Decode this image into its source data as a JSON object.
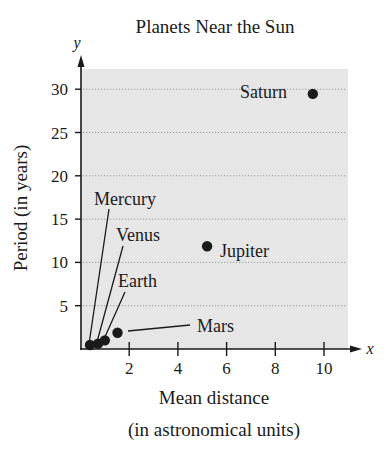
{
  "chart_data": {
    "type": "scatter",
    "title": "Planets Near the Sun",
    "xlabel_lines": [
      "Mean distance",
      "(in astronomical units)"
    ],
    "ylabel": "Period (in years)",
    "x_axis_var": "x",
    "y_axis_var": "y",
    "xlim": [
      0,
      11
    ],
    "ylim": [
      0,
      32
    ],
    "x_ticks": [
      2,
      4,
      6,
      8,
      10
    ],
    "y_ticks": [
      5,
      10,
      15,
      20,
      25,
      30
    ],
    "grid": {
      "horizontal": true,
      "vertical": false,
      "style": "dotted"
    },
    "background": "#e6e6e6",
    "points": [
      {
        "name": "Mercury",
        "x": 0.39,
        "y": 0.24
      },
      {
        "name": "Venus",
        "x": 0.72,
        "y": 0.62
      },
      {
        "name": "Earth",
        "x": 1.0,
        "y": 1.0
      },
      {
        "name": "Mars",
        "x": 1.52,
        "y": 1.88
      },
      {
        "name": "Jupiter",
        "x": 5.2,
        "y": 11.86
      },
      {
        "name": "Saturn",
        "x": 9.54,
        "y": 29.46
      }
    ]
  },
  "colors": {
    "plot_bg": "#e6e6e6",
    "ink": "#1a1a1a",
    "grid": "#9a9a9a"
  }
}
